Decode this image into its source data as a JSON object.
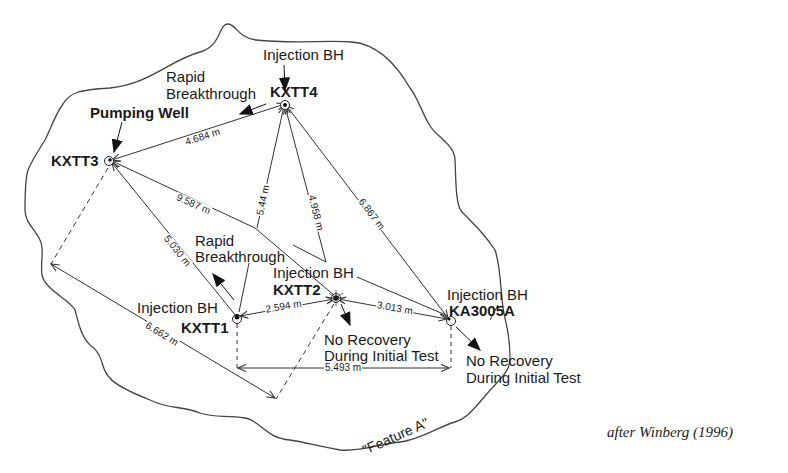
{
  "diagram": {
    "boundary_label": "\"Feature A\"",
    "citation": "after Winberg (1996)",
    "colors": {
      "line": "#333333",
      "text": "#1a1a1a",
      "background": "#ffffff"
    },
    "boreholes": [
      {
        "id": "KXTT3",
        "role": "Pumping Well",
        "x": 110,
        "y": 160
      },
      {
        "id": "KXTT4",
        "role": "Injection BH",
        "note": "Rapid Breakthrough",
        "x": 285,
        "y": 104
      },
      {
        "id": "KXTT1",
        "role": "Injection BH",
        "note": "Rapid Breakthrough",
        "x": 237,
        "y": 318
      },
      {
        "id": "KXTT2",
        "role": "Injection BH",
        "note": "No Recovery During Initial Test",
        "x": 336,
        "y": 298
      },
      {
        "id": "KA3005A",
        "role": "Injection BH",
        "note": "No Recovery During Initial Test",
        "x": 450,
        "y": 320
      }
    ],
    "distances": [
      {
        "from": "KXTT4",
        "to": "KXTT3",
        "label": "4.684 m"
      },
      {
        "from": "KXTT3",
        "to": "KXTT2",
        "label": "9.587 m"
      },
      {
        "from": "KXTT4",
        "to": "KXTT1",
        "label": "5.44 m"
      },
      {
        "from": "KXTT4",
        "to": "KXTT2",
        "label": "4.958 m"
      },
      {
        "from": "KXTT4",
        "to": "KA3005A",
        "label": "6.867 m"
      },
      {
        "from": "KXTT1",
        "to": "KXTT3",
        "label": "5.030 m"
      },
      {
        "from": "KXTT1",
        "to": "KXTT2",
        "label": "2.594 m"
      },
      {
        "from": "KXTT2",
        "to": "KA3005A",
        "label": "3.013 m"
      },
      {
        "from": "corner-left",
        "to": "corner-bottom",
        "label": "6.662 m"
      },
      {
        "from": "KXTT1",
        "to": "KA3005A",
        "label": "5.493 m",
        "note": "horizontal projection"
      }
    ],
    "labels": {
      "kxtt3": "KXTT3",
      "kxtt3_role": "Pumping Well",
      "kxtt4": "KXTT4",
      "kxtt4_role": "Injection BH",
      "kxtt4_note_line1": "Rapid",
      "kxtt4_note_line2": "Breakthrough",
      "kxtt1": "KXTT1",
      "kxtt1_role": "Injection BH",
      "kxtt1_note_line1": "Rapid",
      "kxtt1_note_line2": "Breakthrough",
      "kxtt2": "KXTT2",
      "kxtt2_role": "Injection BH",
      "kxtt2_note_line1": "No Recovery",
      "kxtt2_note_line2": "During Initial Test",
      "ka3005a": "KA3005A",
      "ka3005a_role": "Injection BH",
      "ka3005a_note_line1": "No Recovery",
      "ka3005a_note_line2": "During Initial Test"
    },
    "distance_labels": {
      "d_4_3": "4.684 m",
      "d_3_2": "9.587 m",
      "d_4_1": "5.44 m",
      "d_4_2": "4.958 m",
      "d_4_a": "6.867 m",
      "d_1_3": "5.030 m",
      "d_1_2": "2.594 m",
      "d_2_a": "3.013 m",
      "d_diag": "6.662 m",
      "d_horiz": "5.493 m"
    }
  }
}
